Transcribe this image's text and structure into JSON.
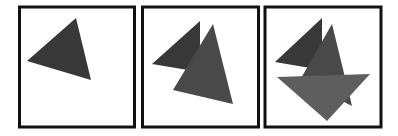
{
  "figure": {
    "colors": {
      "background": "#ffffff",
      "frame": "#111111",
      "triangle_dark": "#383838",
      "triangle_medium": "#494949",
      "triangle_light": "#5e5e5e"
    },
    "panels": [
      {
        "name": "panel-1",
        "triangle_count": 1
      },
      {
        "name": "panel-2",
        "triangle_count": 2
      },
      {
        "name": "panel-3",
        "triangle_count": 3
      }
    ]
  }
}
